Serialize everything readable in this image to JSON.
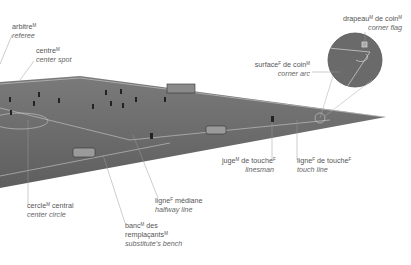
{
  "labels": {
    "referee": {
      "fr": "arbitre",
      "gender": "M",
      "en": "referee"
    },
    "center_spot": {
      "fr": "centre",
      "gender": "M",
      "en": "center spot"
    },
    "corner_flag": {
      "fr1": "drapeau",
      "g1": "M",
      "fr2": " de coin",
      "g2": "M",
      "en": "corner flag"
    },
    "corner_arc": {
      "fr1": "surface",
      "g1": "F",
      "fr2": " de coin",
      "g2": "M",
      "en": "corner arc"
    },
    "linesman": {
      "fr1": "juge",
      "g1": "M",
      "fr2": " de touche",
      "g2": "F",
      "en": "linesman"
    },
    "touch_line": {
      "fr1": "ligne",
      "g1": "F",
      "fr2": " de touche",
      "g2": "F",
      "en": "touch line"
    },
    "center_circle": {
      "fr1": "cercle",
      "g1": "M",
      "fr2": " central",
      "en": "center circle"
    },
    "halfway_line": {
      "fr1": "ligne",
      "g1": "F",
      "fr2": " médiane",
      "en": "halfway line"
    },
    "bench": {
      "fr1": "banc",
      "g1": "M",
      "fr2": " des",
      "fr3": "remplaçants",
      "g3": "M",
      "en": "substitute's bench"
    }
  },
  "colors": {
    "field": "#6e6e6e",
    "field_dark": "#5a5a5a",
    "lines": "#d8d8d8",
    "leader": "#9a9a9a",
    "text": "#555555"
  }
}
